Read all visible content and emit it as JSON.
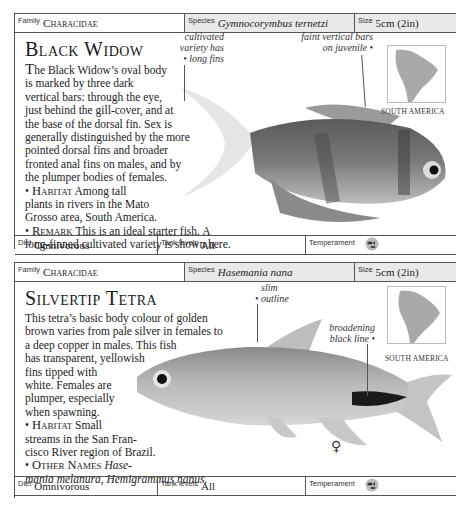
{
  "entries": [
    {
      "header": {
        "family_label": "Family",
        "family_value": "Characidae",
        "species_label": "Species",
        "species_value": "Gymnocorymbus ternetzi",
        "size_label": "Size",
        "size_value": "5cm (2in)"
      },
      "title": "Black Widow",
      "description_lines": [
        "The Black Widow’s oval body",
        "is marked by three dark",
        "vertical bars: through the eye,",
        "just behind the gill-cover, and at",
        "the base of the dorsal fin. Sex is",
        "generally distinguished by the more",
        "pointed dorsal fins and broader",
        "fronted anal fins on males, and by",
        "the plumper bodies of females."
      ],
      "habitat_label": "Habitat",
      "habitat_lines": [
        "Among tall",
        "plants in rivers in the Mato",
        "Grosso area, South America."
      ],
      "remark_label": "Remark",
      "remark_lines": [
        "This is an ideal starter fish. A",
        "long-finned cultivated variety is shown here."
      ],
      "annotations": [
        {
          "lines": [
            "cultivated",
            "variety has",
            "• long fins"
          ]
        },
        {
          "lines": [
            "faint vertical bars",
            "on juvenile •"
          ]
        }
      ],
      "map_label": "SOUTH AMERICA",
      "footer": {
        "diet_label": "Diet",
        "diet_value": "Omnivorous",
        "tank_label": "Tank levels",
        "tank_value": "All",
        "temperament_label": "Temperament",
        "temperament_icon": "peaceful-fish-icon"
      }
    },
    {
      "header": {
        "family_label": "Family",
        "family_value": "Characidae",
        "species_label": "Species",
        "species_value": "Hasemania nana",
        "size_label": "Size",
        "size_value": "5cm (2in)"
      },
      "title": "Silvertip Tetra",
      "description_lines": [
        "This tetra’s basic body colour of golden",
        "brown varies from pale silver in females to",
        "a deep copper in males. This fish",
        "has transparent, yellowish",
        "fins tipped with",
        "white. Females are",
        "plumper, especially",
        "when spawning."
      ],
      "habitat_label": "Habitat",
      "habitat_lines": [
        "Small",
        "streams in the San Fran-",
        "cisco River region of Brazil."
      ],
      "other_label": "Other Names",
      "other_lines": [
        "Hase-",
        "mania melanura, Hemigrammus nanus."
      ],
      "annotations": [
        {
          "lines": [
            "slim",
            "• outline"
          ]
        },
        {
          "lines": [
            "broadening",
            "black line •"
          ]
        }
      ],
      "sex_symbol": "♀",
      "map_label": "SOUTH AMERICA",
      "footer": {
        "diet_label": "Diet",
        "diet_value": "Omnivorous",
        "tank_label": "Tank levels",
        "tank_value": "All",
        "temperament_label": "Temperament",
        "temperament_icon": "peaceful-fish-icon"
      }
    }
  ],
  "colors": {
    "border": "#555555",
    "header_shade": "#e9e9e9",
    "map_land": "#a9a9a9"
  }
}
